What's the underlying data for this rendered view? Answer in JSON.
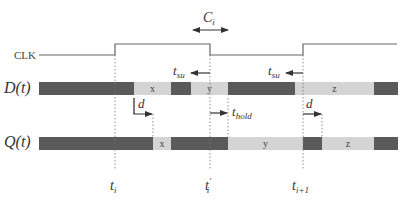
{
  "diagram": {
    "signals": {
      "clk": {
        "label": "CLK"
      },
      "d": {
        "label": "D(t)"
      },
      "q": {
        "label": "Q(t)"
      }
    },
    "d_segments": [
      {
        "state": "invalid",
        "x0": 39,
        "x1": 134,
        "label": ""
      },
      {
        "state": "valid",
        "x0": 134,
        "x1": 171,
        "label": "x"
      },
      {
        "state": "invalid",
        "x0": 171,
        "x1": 191,
        "label": ""
      },
      {
        "state": "valid",
        "x0": 191,
        "x1": 228,
        "label": "y"
      },
      {
        "state": "invalid",
        "x0": 228,
        "x1": 295,
        "label": ""
      },
      {
        "state": "valid",
        "x0": 295,
        "x1": 374,
        "label": "z"
      },
      {
        "state": "invalid",
        "x0": 374,
        "x1": 398,
        "label": ""
      }
    ],
    "q_segments": [
      {
        "state": "invalid",
        "x0": 39,
        "x1": 153,
        "label": ""
      },
      {
        "state": "valid",
        "x0": 153,
        "x1": 171,
        "label": "x"
      },
      {
        "state": "invalid",
        "x0": 171,
        "x1": 228,
        "label": ""
      },
      {
        "state": "valid",
        "x0": 228,
        "x1": 303,
        "label": "y"
      },
      {
        "state": "invalid",
        "x0": 303,
        "x1": 322,
        "label": ""
      },
      {
        "state": "valid",
        "x0": 322,
        "x1": 374,
        "label": "z"
      },
      {
        "state": "invalid",
        "x0": 374,
        "x1": 398,
        "label": ""
      }
    ],
    "annotations": {
      "ci": "C",
      "ci_sub": "i",
      "tsu": "t",
      "tsu_sub": "su",
      "thold": "t",
      "thold_sub": "hold",
      "d": "d"
    },
    "time_labels": [
      {
        "main": "t",
        "sub": "i",
        "prime": ""
      },
      {
        "main": "t",
        "sub": "i",
        "prime": "′"
      },
      {
        "main": "t",
        "sub": "i+1",
        "prime": ""
      }
    ],
    "colors": {
      "invalid": "#5a5a5a",
      "valid": "#d4d4d4",
      "line": "#555555",
      "text": "#333333"
    }
  }
}
